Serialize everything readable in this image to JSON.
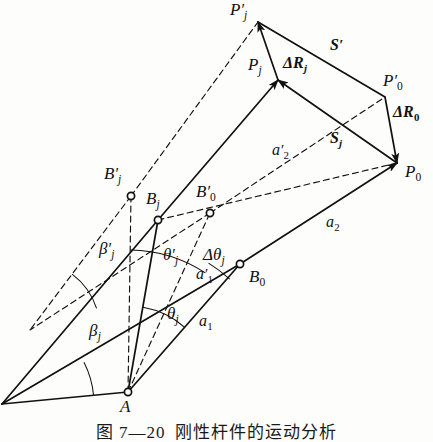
{
  "figure": {
    "kind": "geometric-vector-diagram",
    "caption_number": "图 7—20",
    "caption_title": "刚性杆件的运动分析",
    "stroke_color": "#111111",
    "background_color": "#fdfdfb"
  },
  "points": [
    {
      "id": "A",
      "label_main": "A",
      "prime": "",
      "sub": "",
      "x": 128,
      "y": 392,
      "label_x": 120,
      "label_y": 398,
      "marker": true
    },
    {
      "id": "B0",
      "label_main": "B",
      "prime": "",
      "sub": "0",
      "x": 240,
      "y": 264,
      "label_x": 249,
      "label_y": 268,
      "marker": true
    },
    {
      "id": "Bj",
      "label_main": "B",
      "prime": "",
      "sub": "j",
      "x": 158,
      "y": 220,
      "label_x": 146,
      "label_y": 190,
      "marker": true
    },
    {
      "id": "Bjp",
      "label_main": "B",
      "prime": "′",
      "sub": "j",
      "x": 131,
      "y": 196,
      "label_x": 104,
      "label_y": 165,
      "marker": true
    },
    {
      "id": "B0p",
      "label_main": "B",
      "prime": "′",
      "sub": "0",
      "x": 210,
      "y": 213,
      "label_x": 196,
      "label_y": 183,
      "marker": true
    },
    {
      "id": "P0",
      "label_main": "P",
      "prime": "",
      "sub": "0",
      "x": 397,
      "y": 163,
      "label_x": 405,
      "label_y": 163,
      "marker": false
    },
    {
      "id": "P0p",
      "label_main": "P",
      "prime": "′",
      "sub": "0",
      "x": 385,
      "y": 97,
      "label_x": 383,
      "label_y": 72,
      "marker": false
    },
    {
      "id": "Pj",
      "label_main": "P",
      "prime": "",
      "sub": "j",
      "x": 278,
      "y": 80,
      "label_x": 248,
      "label_y": 56,
      "marker": false
    },
    {
      "id": "Pjp",
      "label_main": "P",
      "prime": "′",
      "sub": "j",
      "x": 258,
      "y": 22,
      "label_x": 230,
      "label_y": 1,
      "marker": false
    }
  ],
  "vector_labels": [
    {
      "id": "S-prime",
      "text": "S",
      "prime": "′",
      "sub": "",
      "x": 330,
      "y": 37,
      "bold": true
    },
    {
      "id": "S-j",
      "text": "S",
      "prime": "",
      "sub": "j",
      "x": 330,
      "y": 130,
      "bold": true
    },
    {
      "id": "dR-j",
      "text": "ΔR",
      "prime": "",
      "sub": "j",
      "x": 283,
      "y": 55,
      "bold": true
    },
    {
      "id": "dR-0",
      "text": "ΔR",
      "prime": "",
      "sub": "0",
      "x": 393,
      "y": 104,
      "bold": true
    }
  ],
  "length_labels": [
    {
      "id": "a1",
      "text": "a",
      "prime": "",
      "sub": "1",
      "x": 199,
      "y": 313
    },
    {
      "id": "a1-prime",
      "text": "a",
      "prime": "′",
      "sub": "1",
      "x": 196,
      "y": 266
    },
    {
      "id": "a2",
      "text": "a",
      "prime": "",
      "sub": "2",
      "x": 326,
      "y": 214
    },
    {
      "id": "a2-prime",
      "text": "a",
      "prime": "′",
      "sub": "2",
      "x": 272,
      "y": 142
    }
  ],
  "angle_labels": [
    {
      "id": "beta-j",
      "text": "β",
      "prime": "",
      "sub": "j",
      "x": 89,
      "y": 322
    },
    {
      "id": "beta-j-prime",
      "text": "β",
      "prime": "′",
      "sub": "j",
      "x": 99,
      "y": 240
    },
    {
      "id": "theta-j",
      "text": "θ",
      "prime": "",
      "sub": "j",
      "x": 167,
      "y": 305
    },
    {
      "id": "theta-j-prime",
      "text": "θ",
      "prime": "′",
      "sub": "j",
      "x": 163,
      "y": 246
    },
    {
      "id": "delta-theta-j",
      "text": "Δθ",
      "prime": "",
      "sub": "j",
      "x": 203,
      "y": 246
    }
  ],
  "solid_segments": [
    {
      "id": "A-to-B0",
      "x1": 128,
      "y1": 392,
      "x2": 240,
      "y2": 264
    },
    {
      "id": "B0-to-P0",
      "x1": 240,
      "y1": 264,
      "x2": 397,
      "y2": 163,
      "arrow": true
    },
    {
      "id": "A-to-Bj",
      "x1": 128,
      "y1": 392,
      "x2": 158,
      "y2": 220
    },
    {
      "id": "Bj-to-Pj",
      "x1": 158,
      "y1": 220,
      "x2": 278,
      "y2": 80,
      "arrow": true
    },
    {
      "id": "Pj-to-Pjp",
      "x1": 278,
      "y1": 80,
      "x2": 258,
      "y2": 22,
      "arrow": true
    },
    {
      "id": "Pjp-to-P0p",
      "x1": 258,
      "y1": 22,
      "x2": 385,
      "y2": 97
    },
    {
      "id": "P0p-to-P0",
      "x1": 385,
      "y1": 97,
      "x2": 397,
      "y2": 163,
      "arrow": true
    },
    {
      "id": "P0-to-Pj",
      "x1": 397,
      "y1": 163,
      "x2": 278,
      "y2": 80,
      "arrow": true
    },
    {
      "id": "leftray-A",
      "x1": 128,
      "y1": 392,
      "x2": 2,
      "y2": 404
    },
    {
      "id": "leftray-B",
      "x1": 240,
      "y1": 264,
      "x2": 2,
      "y2": 404
    },
    {
      "id": "leftray-C",
      "x1": 158,
      "y1": 220,
      "x2": 2,
      "y2": 404
    }
  ],
  "dashed_segments": [
    {
      "id": "A-to-Bjp",
      "x1": 128,
      "y1": 392,
      "x2": 131,
      "y2": 196
    },
    {
      "id": "A-to-B0p",
      "x1": 128,
      "y1": 392,
      "x2": 210,
      "y2": 213
    },
    {
      "id": "Bjp-to-Pjp",
      "x1": 131,
      "y1": 196,
      "x2": 258,
      "y2": 22
    },
    {
      "id": "B0p-to-P0p",
      "x1": 210,
      "y1": 213,
      "x2": 385,
      "y2": 97
    },
    {
      "id": "leftray-Dp",
      "x1": 131,
      "y1": 196,
      "x2": 30,
      "y2": 330
    },
    {
      "id": "leftray-Ep",
      "x1": 210,
      "y1": 213,
      "x2": 30,
      "y2": 330
    },
    {
      "id": "a2prime",
      "x1": 158,
      "y1": 220,
      "x2": 397,
      "y2": 163
    }
  ],
  "angle_arcs": [
    {
      "id": "arc-beta-j",
      "cx": 2,
      "cy": 404,
      "r": 92,
      "a1": -5,
      "a2": -27
    },
    {
      "id": "arc-beta-j-prime",
      "cx": 30,
      "cy": 330,
      "r": 70,
      "a1": -18,
      "a2": -53
    },
    {
      "id": "arc-theta-j",
      "cx": 128,
      "cy": 392,
      "r": 86,
      "a1": -49,
      "a2": -80
    },
    {
      "id": "arc-theta-j-prime",
      "cx": 128,
      "cy": 392,
      "r": 142,
      "a1": -57,
      "a2": -89
    },
    {
      "id": "arc-delta-theta-j",
      "cx": 128,
      "cy": 392,
      "r": 152,
      "a1": -48,
      "a2": -58
    }
  ]
}
